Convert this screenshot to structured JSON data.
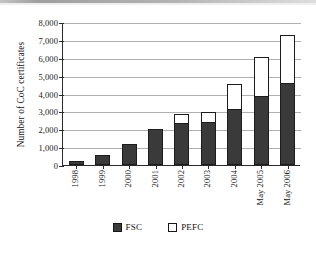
{
  "chart_data": {
    "type": "bar",
    "stacked": true,
    "title": "",
    "xlabel": "",
    "ylabel": "Number of CoC certificates",
    "ylim": [
      0,
      8000
    ],
    "ytick_step": 1000,
    "ytick_labels": [
      "8,000",
      "7,000",
      "6,000",
      "5,000",
      "4,000",
      "3,000",
      "2,000",
      "1,000",
      "0"
    ],
    "ytick_values": [
      8000,
      7000,
      6000,
      5000,
      4000,
      3000,
      2000,
      1000,
      0
    ],
    "grid": true,
    "grid_axis": "y",
    "legend_position": "bottom",
    "categories": [
      "1998",
      "1999",
      "2000",
      "2001",
      "2002",
      "2003",
      "2004",
      "May 2005",
      "May 2006"
    ],
    "series": [
      {
        "name": "FSC",
        "color": "#3a3a3a",
        "values": [
          200,
          580,
          1150,
          2030,
          2330,
          2380,
          3130,
          3870,
          4600
        ]
      },
      {
        "name": "PEFC",
        "color": "#ffffff",
        "values": [
          0,
          0,
          0,
          0,
          520,
          600,
          1410,
          2150,
          2650
        ]
      }
    ],
    "totals": [
      200,
      580,
      1150,
      2030,
      2850,
      2980,
      4540,
      6020,
      7250
    ]
  },
  "legend": {
    "items": [
      {
        "label": "FSC"
      },
      {
        "label": "PEFC"
      }
    ]
  },
  "colors": {
    "fsc_fill": "#3a3a3a",
    "pefc_fill": "#ffffff",
    "outline": "#1c1c1c",
    "axis": "#2b2b2b",
    "gridline": "#b0b0b0"
  }
}
